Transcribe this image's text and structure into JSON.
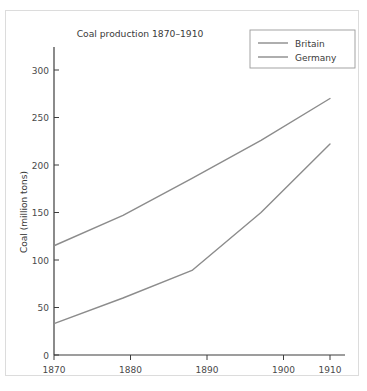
{
  "figure": {
    "title": "Coal production 1870–1910",
    "background_color": "#ffffff",
    "frame_color": "#dcdcdc"
  },
  "chart_data": {
    "type": "line",
    "title": "Coal production 1870–1910",
    "xlabel": "",
    "ylabel": "Coal (million tons)",
    "x": [
      1870,
      1880,
      1890,
      1900,
      1910
    ],
    "xticklabels": [
      "1870",
      "1880",
      "1890",
      "1900",
      "1910"
    ],
    "yticks": [
      0,
      50,
      100,
      150,
      200,
      250,
      300
    ],
    "yticklabels": [
      "0",
      "50",
      "100",
      "150",
      "200",
      "250",
      "300"
    ],
    "xlim": [
      1870,
      1914
    ],
    "ylim": [
      0,
      320
    ],
    "grid": false,
    "legend_position": "top-right",
    "series": [
      {
        "name": "Britain",
        "color": "#8c8c8c",
        "values": [
          115,
          147,
          186,
          226,
          270
        ]
      },
      {
        "name": "Germany",
        "color": "#8c8c8c",
        "values": [
          33,
          60,
          89,
          150,
          222
        ]
      }
    ]
  },
  "legend": {
    "entries": [
      {
        "label": "Britain"
      },
      {
        "label": "Germany"
      }
    ]
  }
}
